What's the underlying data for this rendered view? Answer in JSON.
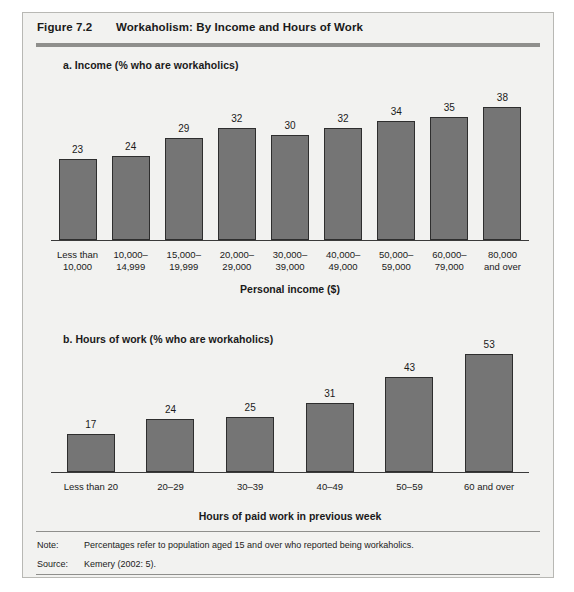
{
  "figure": {
    "number": "Figure 7.2",
    "title": "Workaholism: By Income and Hours of Work"
  },
  "panel_a": {
    "title": "a. Income (% who are workaholics)",
    "axis_title": "Personal income ($)"
  },
  "panel_b": {
    "title": "b. Hours of work (% who are workaholics)",
    "axis_title": "Hours of paid work in previous week"
  },
  "footer": {
    "note_key": "Note:",
    "note_text": "Percentages refer to population aged 15 and over who reported being workaholics.",
    "source_key": "Source:",
    "source_text": "Kemery (2002: 5)."
  },
  "colors": {
    "bar_fill": "#757575",
    "bar_stroke": "#2e2e2e",
    "panel_background": "#f2f2f0",
    "rule": "#8f8f8c"
  },
  "chart_data": [
    {
      "type": "bar",
      "id": "panel-a",
      "title": "a. Income (% who are workaholics)",
      "xlabel": "Personal income ($)",
      "ylabel": "% who are workaholics",
      "ylim": [
        0,
        40
      ],
      "grid": false,
      "legend": "none",
      "categories": [
        "Less than\n10,000",
        "10,000–\n14,999",
        "15,000–\n19,999",
        "20,000–\n29,000",
        "30,000–\n39,000",
        "40,000–\n49,000",
        "50,000–\n59,000",
        "60,000–\n79,000",
        "80,000\nand over"
      ],
      "categories_lines": [
        [
          "Less than",
          "10,000"
        ],
        [
          "10,000–",
          "14,999"
        ],
        [
          "15,000–",
          "19,999"
        ],
        [
          "20,000–",
          "29,000"
        ],
        [
          "30,000–",
          "39,000"
        ],
        [
          "40,000–",
          "49,000"
        ],
        [
          "50,000–",
          "59,000"
        ],
        [
          "60,000–",
          "79,000"
        ],
        [
          "80,000",
          "and over"
        ]
      ],
      "values": [
        23,
        24,
        29,
        32,
        30,
        32,
        34,
        35,
        38
      ]
    },
    {
      "type": "bar",
      "id": "panel-b",
      "title": "b. Hours of work (% who are workaholics)",
      "xlabel": "Hours of paid work in previous week",
      "ylabel": "% who are workaholics",
      "ylim": [
        0,
        55
      ],
      "grid": false,
      "legend": "none",
      "categories": [
        "Less than 20",
        "20–29",
        "30–39",
        "40–49",
        "50–59",
        "60 and over"
      ],
      "categories_lines": [
        [
          "Less than 20"
        ],
        [
          "20–29"
        ],
        [
          "30–39"
        ],
        [
          "40–49"
        ],
        [
          "50–59"
        ],
        [
          "60 and over"
        ]
      ],
      "values": [
        17,
        24,
        25,
        31,
        43,
        53
      ]
    }
  ]
}
